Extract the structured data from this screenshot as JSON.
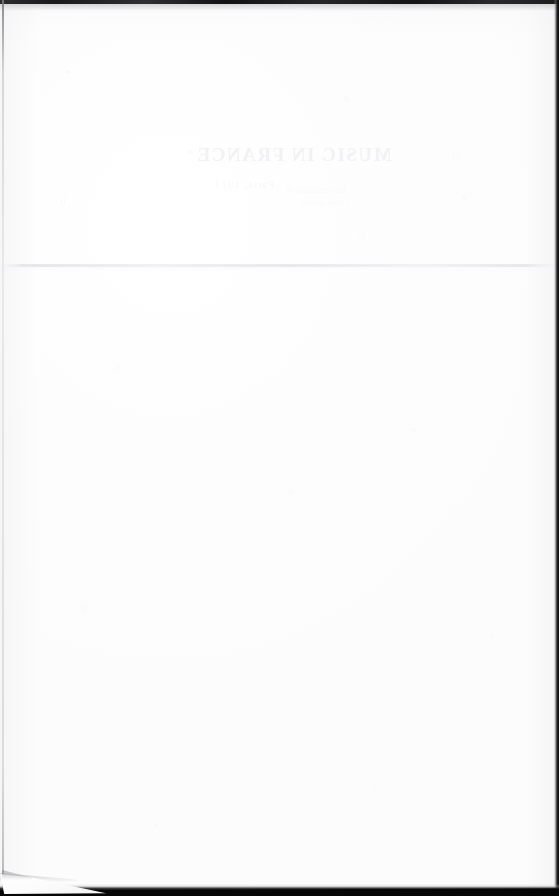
{
  "page": {
    "kind": "scanned-blank-page",
    "width": 559,
    "height": 896,
    "paper_color": "#fdfdfd",
    "has_visible_text": false
  },
  "artifacts": {
    "top_edge": {
      "name": "scan-edge-top",
      "color": "#1a1a1a",
      "height_px": 4
    },
    "left_edge": {
      "name": "scan-edge-left",
      "color": "#bcbcc0",
      "width_px": 2
    },
    "right_edge": {
      "name": "scan-edge-right",
      "color": "#0a0a0a",
      "width_px": 5
    },
    "bottom_edge": {
      "name": "scan-edge-bottom",
      "color": "#000000",
      "height_px": 12
    },
    "crease": {
      "name": "horizontal-fold-crease",
      "y_px": 264,
      "color": "#e2e2e5"
    },
    "corner": {
      "name": "torn-corner-bottom-left",
      "width_px": 112,
      "height_px": 30,
      "color": "#f2f2f4"
    }
  },
  "showthrough": {
    "note": "Faint mirrored ink bleeding through from the reverse side of the sheet",
    "color": "#f3f3f5",
    "title": "MUSIC IN FRANCE",
    "subtitle": "Paris, 1913",
    "line_a": "the orchestra of",
    "line_b": "a new season",
    "line_c": "21",
    "mark_left": "II",
    "mark_right": "of"
  }
}
